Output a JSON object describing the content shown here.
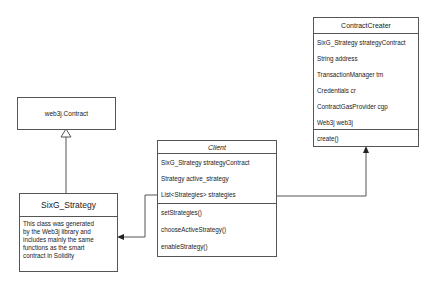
{
  "diagram": {
    "type": "uml-class-diagram",
    "classes": [
      {
        "id": "contract_creater",
        "name": "ContractCreater",
        "attributes": [
          "SixG_Strategy strategyContract",
          "String address",
          "TransactionManager tm",
          "Credentials cr",
          "ContractGasProvider cgp",
          "Web3j web3j"
        ],
        "methods": [
          "create()"
        ]
      },
      {
        "id": "web3j_contract",
        "name": "web3j.Contract",
        "attributes": [],
        "methods": []
      },
      {
        "id": "sixg_strategy",
        "name": "SixG_Strategy",
        "note": "This class was generated by the Web3j library and includes mainly the same functions as the smart contract in Solidity",
        "note_lines": [
          "This class was generated",
          "by the Web3j library and",
          "includes mainly the same",
          "functions as the smart",
          "contract in Solidity"
        ]
      },
      {
        "id": "client",
        "name": "Client",
        "name_style": "italic",
        "attributes": [
          "SixG_Strategy strategyContract",
          "Strategy active_strategy",
          "List<Strategies> strategies"
        ],
        "methods": [
          "setStrategies()",
          "chooseActiveStrategy()",
          "enableStrategy()"
        ]
      }
    ],
    "relationships": [
      {
        "from": "sixg_strategy",
        "to": "web3j_contract",
        "type": "inheritance"
      },
      {
        "from": "client",
        "to": "sixg_strategy",
        "type": "association"
      },
      {
        "from": "client",
        "to": "contract_creater",
        "type": "association"
      }
    ]
  }
}
